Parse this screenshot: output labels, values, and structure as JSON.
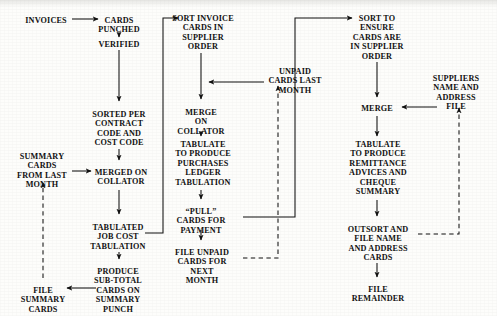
{
  "diagram": {
    "style": {
      "background": "#fdfdfb",
      "ink": "#111111",
      "solid_line": "#111111",
      "dashed_line": "#111111"
    },
    "nodes": [
      {
        "id": "invoices",
        "label": "INVOICES",
        "x": 46,
        "y": 16
      },
      {
        "id": "cards-punched",
        "label": "CARDS\nPUNCHED",
        "x": 119,
        "y": 16
      },
      {
        "id": "verified",
        "label": "VERIFIED",
        "x": 119,
        "y": 40
      },
      {
        "id": "sorted-per",
        "label": "SORTED PER\nCONTRACT\nCODE AND\nCOST CODE",
        "x": 119,
        "y": 110
      },
      {
        "id": "summary-last",
        "label": "SUMMARY\nCARDS\nFROM LAST\nMONTH",
        "x": 42,
        "y": 152
      },
      {
        "id": "merged-collator",
        "label": "MERGED ON\nCOLLATOR",
        "x": 121,
        "y": 168
      },
      {
        "id": "tabulated-job",
        "label": "TABULATED\nJOB COST\nTABULATION",
        "x": 118,
        "y": 223
      },
      {
        "id": "produce-subtotal",
        "label": "PRODUCE\nSUB-TOTAL\nCARDS ON\nSUMMARY\nPUNCH",
        "x": 118,
        "y": 267
      },
      {
        "id": "file-summary",
        "label": "FILE\nSUMMARY\nCARDS",
        "x": 43,
        "y": 286
      },
      {
        "id": "sort-invoice",
        "label": "SORT INVOICE\nCARDS IN\nSUPPLIER\nORDER",
        "x": 203,
        "y": 14
      },
      {
        "id": "merge-collator",
        "label": "MERGE\nON\nCOLLATOR",
        "x": 201,
        "y": 108
      },
      {
        "id": "tabulate-ledger",
        "label": "TABULATE\nTO PRODUCE\nPURCHASES\nLEDGER\nTABULATION",
        "x": 203,
        "y": 140
      },
      {
        "id": "pull-cards",
        "label": "“PULL”\nCARDS FOR\nPAYMENT",
        "x": 201,
        "y": 207
      },
      {
        "id": "file-unpaid",
        "label": "FILE UNPAID\nCARDS FOR\nNEXT\nMONTH",
        "x": 202,
        "y": 248
      },
      {
        "id": "unpaid-last",
        "label": "UNPAID\nCARDS LAST\nMONTH",
        "x": 295,
        "y": 67
      },
      {
        "id": "sort-ensure",
        "label": "SORT TO\nENSURE\nCARDS ARE\nIN SUPPLIER\nORDER",
        "x": 377,
        "y": 14
      },
      {
        "id": "merge-right",
        "label": "MERGE",
        "x": 377,
        "y": 104
      },
      {
        "id": "suppliers-file",
        "label": "SUPPLIERS\nNAME AND\nADDRESS\nFILE",
        "x": 456,
        "y": 74
      },
      {
        "id": "tabulate-remit",
        "label": "TABULATE\nTO PRODUCE\nREMITTANCE\nADVICES AND\nCHEQUE\nSUMMARY",
        "x": 378,
        "y": 140
      },
      {
        "id": "outsort-file",
        "label": "OUTSORT AND\nFILE NAME\nAND ADDRESS\nCARDS",
        "x": 378,
        "y": 225
      },
      {
        "id": "file-remainder",
        "label": "FILE\nREMAINDER",
        "x": 378,
        "y": 285
      }
    ],
    "connections": [
      {
        "id": "invoices-to-cards",
        "from": "invoices",
        "to": "cards-punched",
        "kind": "solid",
        "arrow": true
      },
      {
        "id": "cards-to-verified",
        "from": "cards-punched",
        "to": "verified",
        "kind": "solid",
        "arrow": true
      },
      {
        "id": "verified-to-sorted",
        "from": "verified",
        "to": "sorted-per",
        "kind": "solid",
        "arrow": true
      },
      {
        "id": "sorted-to-merged",
        "from": "sorted-per",
        "to": "merged-collator",
        "kind": "solid",
        "arrow": true
      },
      {
        "id": "summarylast-to-merged",
        "from": "summary-last",
        "to": "merged-collator",
        "kind": "solid",
        "arrow": true
      },
      {
        "id": "merged-to-tabulated",
        "from": "merged-collator",
        "to": "tabulated-job",
        "kind": "solid",
        "arrow": true
      },
      {
        "id": "tabulated-to-subtotal",
        "from": "tabulated-job",
        "to": "produce-subtotal",
        "kind": "solid",
        "arrow": true
      },
      {
        "id": "subtotal-to-filesummary",
        "from": "produce-subtotal",
        "to": "file-summary",
        "kind": "solid",
        "arrow": true
      },
      {
        "id": "filesummary-to-summarylast",
        "from": "file-summary",
        "to": "summary-last",
        "kind": "dashed",
        "arrow": true
      },
      {
        "id": "tabulated-to-sortinvoice",
        "from": "tabulated-job",
        "to": "sort-invoice",
        "kind": "solid",
        "arrow": true
      },
      {
        "id": "sortinvoice-to-mergecollator",
        "from": "sort-invoice",
        "to": "merge-collator",
        "kind": "solid",
        "arrow": true
      },
      {
        "id": "unpaidlast-to-mergecollator",
        "from": "unpaid-last",
        "to": "merge-collator",
        "kind": "solid",
        "arrow": true
      },
      {
        "id": "mergecollator-to-ledger",
        "from": "merge-collator",
        "to": "tabulate-ledger",
        "kind": "solid",
        "arrow": true
      },
      {
        "id": "ledger-to-pull",
        "from": "tabulate-ledger",
        "to": "pull-cards",
        "kind": "solid",
        "arrow": true
      },
      {
        "id": "pull-to-fileunpaid",
        "from": "pull-cards",
        "to": "file-unpaid",
        "kind": "solid",
        "arrow": true
      },
      {
        "id": "pull-to-sortensure",
        "from": "pull-cards",
        "to": "sort-ensure",
        "kind": "solid",
        "arrow": true
      },
      {
        "id": "fileunpaid-to-unpaidlast",
        "from": "file-unpaid",
        "to": "unpaid-last",
        "kind": "dashed",
        "arrow": true
      },
      {
        "id": "sortensure-to-mergeright",
        "from": "sort-ensure",
        "to": "merge-right",
        "kind": "solid",
        "arrow": true
      },
      {
        "id": "suppliers-to-mergeright",
        "from": "suppliers-file",
        "to": "merge-right",
        "kind": "solid",
        "arrow": true
      },
      {
        "id": "mergeright-to-remit",
        "from": "merge-right",
        "to": "tabulate-remit",
        "kind": "solid",
        "arrow": true
      },
      {
        "id": "remit-to-outsort",
        "from": "tabulate-remit",
        "to": "outsort-file",
        "kind": "solid",
        "arrow": true
      },
      {
        "id": "outsort-to-suppliers",
        "from": "outsort-file",
        "to": "suppliers-file",
        "kind": "dashed",
        "arrow": true
      },
      {
        "id": "outsort-to-remainder",
        "from": "outsort-file",
        "to": "file-remainder",
        "kind": "solid",
        "arrow": true
      }
    ]
  }
}
